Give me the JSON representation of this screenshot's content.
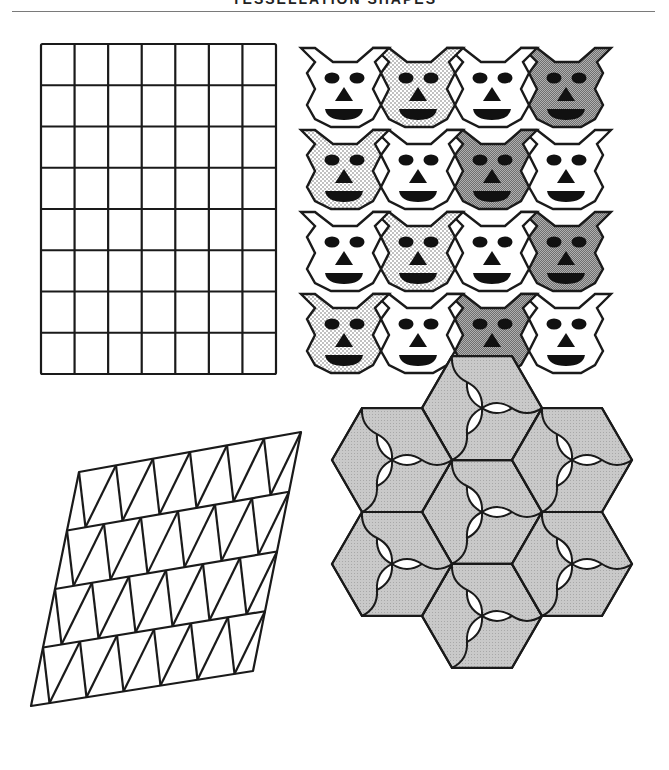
{
  "header": {
    "title": "TESSELLATION SHAPES",
    "title_visible": "partially cropped at top edge"
  },
  "figures": [
    {
      "id": "rect-grid",
      "description": "Rectangular grid",
      "columns": 7,
      "rows": 8
    },
    {
      "id": "face-tessellation",
      "description": "Tessellation of cat/bear-face tiles",
      "columns": 4,
      "rows": 4,
      "fills": [
        [
          "white",
          "dotted",
          "white",
          "dark"
        ],
        [
          "dotted",
          "white",
          "dark",
          "white"
        ],
        [
          "white",
          "dotted",
          "white",
          "dark"
        ],
        [
          "dotted",
          "white",
          "dark",
          "white"
        ]
      ]
    },
    {
      "id": "triangle-grid",
      "description": "Parallelogram subdivided into triangles",
      "columns": 6,
      "rows": 4
    },
    {
      "id": "hexagon-tessellation",
      "description": "Seven hexagons each divided into three curved pinwheel tiles, alternating grey and white",
      "hexagon_count": 7
    }
  ],
  "colors": {
    "line": "#1a1a1a",
    "dark_fill": "#8c8c8c",
    "dotted_fill": "#e8e8e8",
    "grey_fill": "#c4c4c4",
    "white": "#ffffff",
    "rule": "#7a7a7a"
  }
}
